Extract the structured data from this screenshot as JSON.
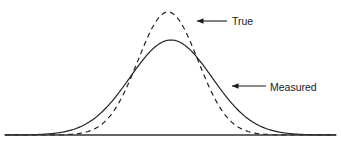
{
  "figure": {
    "title": "",
    "background_color": "#ffffff",
    "line_color": "#222222",
    "axis_color": "#333333"
  },
  "annotations": {
    "true_label": "True",
    "measured_label": "Measured"
  },
  "chart_data": {
    "type": "line",
    "title": "",
    "xlabel": "",
    "ylabel": "",
    "grid": false,
    "legend_position": "inline-annotations",
    "axis": {
      "baseline_y": 135,
      "x_start": 5,
      "x_end": 336,
      "y_axis_shown": false,
      "x_axis_shown": true,
      "ticks": [],
      "tick_labels": []
    },
    "series": [
      {
        "name": "True",
        "style": "dashed",
        "color": "#222222",
        "peak_x": 168,
        "peak_y_px": 12,
        "sigma_px": 30,
        "amplitude_px": 123,
        "annotation": {
          "label": "True",
          "text_x": 232,
          "text_y": 25,
          "arrow_tip_x": 197,
          "arrow_tip_y": 21,
          "arrow_tail_x": 227,
          "arrow_tail_y": 21
        }
      },
      {
        "name": "Measured",
        "style": "solid",
        "color": "#222222",
        "peak_x": 171,
        "peak_y_px": 40,
        "sigma_px": 41,
        "amplitude_px": 95,
        "annotation": {
          "label": "Measured",
          "text_x": 270,
          "text_y": 91,
          "arrow_tip_x": 232,
          "arrow_tip_y": 86,
          "arrow_tail_x": 266,
          "arrow_tail_y": 86
        }
      }
    ]
  }
}
